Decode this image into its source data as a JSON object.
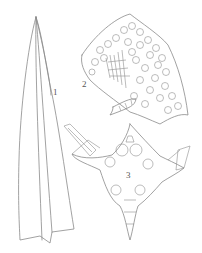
{
  "figure": {
    "labels": [
      {
        "id": "1",
        "text": "1",
        "x": 53,
        "y": 92
      },
      {
        "id": "2",
        "text": "2",
        "x": 82,
        "y": 84
      },
      {
        "id": "3",
        "text": "3",
        "x": 126,
        "y": 175
      }
    ],
    "parts": [
      {
        "id": "1",
        "description": "leaf outline"
      },
      {
        "id": "2",
        "description": "leaf apex cell areolation"
      },
      {
        "id": "3",
        "description": "stellate cell cluster / cross-section"
      }
    ],
    "line_color": "#8a8a8a",
    "background": "#ffffff"
  }
}
